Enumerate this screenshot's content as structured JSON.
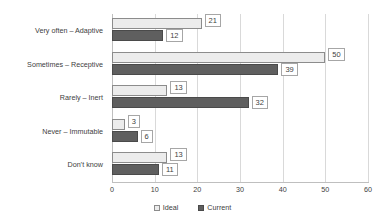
{
  "chart_data": {
    "type": "bar",
    "orientation": "horizontal",
    "title": "",
    "subtitle": "",
    "xlabel": "",
    "ylabel": "",
    "xlim": [
      0,
      60
    ],
    "xticks": [
      0,
      10,
      20,
      30,
      40,
      50,
      60
    ],
    "grid": true,
    "legend_position": "bottom",
    "categories": [
      "Very often – Adaptive",
      "Sometimes – Receptive",
      "Rarely – Inert",
      "Never – Immutable",
      "Don’t know"
    ],
    "series": [
      {
        "name": "Ideal",
        "color": "#ececec",
        "border": "#8c8c8c",
        "values": [
          21,
          50,
          13,
          3,
          13
        ]
      },
      {
        "name": "Current",
        "color": "#5f5f5f",
        "border": "#4a4a4a",
        "values": [
          12,
          39,
          32,
          6,
          11
        ]
      }
    ],
    "data_labels": {
      "Ideal": [
        "21",
        "50",
        "13",
        "3",
        "13"
      ],
      "Current": [
        "12",
        "39",
        "32",
        "6",
        "11"
      ]
    }
  },
  "axis": {
    "tick_labels": [
      "0",
      "10",
      "20",
      "30",
      "40",
      "50",
      "60"
    ]
  },
  "legend": {
    "items": [
      {
        "label": "Ideal",
        "swatch": "legend-swatch-ideal"
      },
      {
        "label": "Current",
        "swatch": "legend-swatch-current"
      }
    ]
  }
}
